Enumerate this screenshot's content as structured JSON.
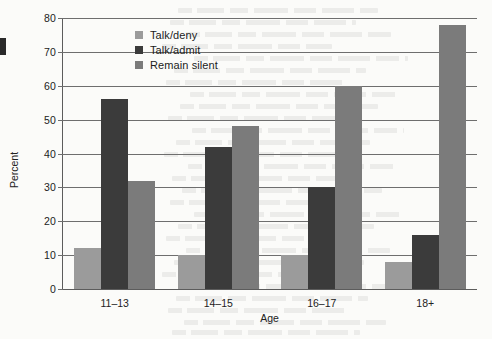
{
  "chart_data": {
    "type": "bar",
    "title": "",
    "xlabel": "Age",
    "ylabel": "Percent",
    "categories": [
      "11–13",
      "14–15",
      "16–17",
      "18+"
    ],
    "series": [
      {
        "name": "Talk/deny",
        "values": [
          12,
          10,
          10,
          8
        ],
        "color": "#9b9b9b"
      },
      {
        "name": "Talk/admit",
        "values": [
          56,
          42,
          30,
          16
        ],
        "color": "#3b3b3b"
      },
      {
        "name": "Remain silent",
        "values": [
          32,
          48,
          60,
          78
        ],
        "color": "#7b7b7b"
      }
    ],
    "ylim": [
      0,
      80
    ],
    "yticks": [
      0,
      10,
      20,
      30,
      40,
      50,
      60,
      70,
      80
    ],
    "ytick_labels": [
      "0",
      "10",
      "20",
      "30",
      "40",
      "50",
      "60",
      "70",
      "80"
    ],
    "grid": true,
    "legend_position": "top-center-left",
    "grouped": true
  },
  "axes": {
    "y_title": "Percent",
    "x_title": "Age"
  }
}
